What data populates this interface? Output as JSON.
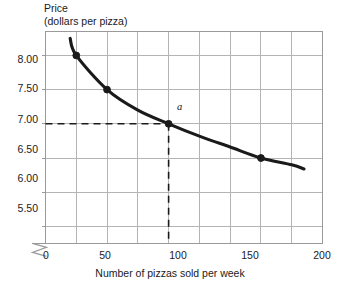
{
  "chart_data": {
    "type": "line",
    "title": "",
    "ylabel_line1": "Price",
    "ylabel_line2": "(dollars per pizza)",
    "xlabel": "Number of pizzas sold per week",
    "xlim": [
      0,
      225
    ],
    "ylim": [
      5.25,
      8.35
    ],
    "grid": true,
    "legend": "none",
    "x_ticks": [
      0,
      50,
      100,
      150,
      200
    ],
    "x_tick_labels": [
      "0",
      "50",
      "100",
      "150",
      "200"
    ],
    "x_gridlines": [
      25,
      50,
      75,
      100,
      125,
      150,
      175,
      200,
      225
    ],
    "y_ticks": [
      5.5,
      6.0,
      6.5,
      7.0,
      7.5,
      8.0
    ],
    "y_tick_labels": [
      "5.50",
      "6.00",
      "6.50",
      "7.00",
      "7.50",
      "8.00"
    ],
    "axis_break": true,
    "series": [
      {
        "name": "Demand",
        "x": [
          20,
          25,
          50,
          75,
          100,
          125,
          150,
          175,
          200,
          210
        ],
        "y": [
          8.25,
          8.0,
          7.5,
          7.2,
          7.0,
          6.82,
          6.66,
          6.5,
          6.4,
          6.34
        ]
      }
    ],
    "markers": [
      {
        "x": 25,
        "y": 8.0,
        "label": ""
      },
      {
        "x": 50,
        "y": 7.5,
        "label": ""
      },
      {
        "x": 100,
        "y": 7.0,
        "label": "a"
      },
      {
        "x": 175,
        "y": 6.5,
        "label": ""
      }
    ],
    "annotations": [
      {
        "name": "guide-price",
        "type": "dashed-horizontal",
        "y": 7.0,
        "from_x": 0,
        "to_x": 100
      },
      {
        "name": "guide-quantity",
        "type": "dashed-vertical",
        "x": 100,
        "from_y": 5.25,
        "to_y": 7.0
      }
    ],
    "colors": {
      "curve": "#1a1a1a",
      "grid": "#b4b4b4",
      "frame": "#9a9a9a",
      "dashed": "#1a1a1a",
      "text": "#1a1a1a",
      "background": "#ffffff"
    }
  }
}
